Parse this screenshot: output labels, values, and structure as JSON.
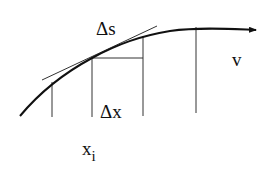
{
  "diagram": {
    "labels": {
      "arc_length": "Δs",
      "increment": "Δx",
      "point": "x",
      "point_subscript": "i",
      "curve_name": "v"
    },
    "elements": [
      "curve-with-arrow",
      "tangent-line",
      "vertical-grid-lines",
      "horizontal-increment-segment"
    ],
    "colors": {
      "ink": "#111111",
      "background": "#ffffff"
    }
  }
}
